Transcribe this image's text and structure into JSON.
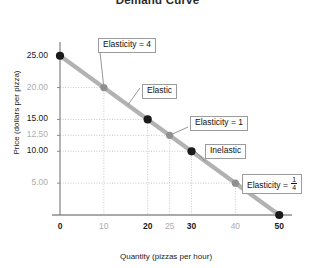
{
  "chart_data": {
    "type": "line",
    "title": "Demand Curve",
    "xlabel": "Quantity (pizzas per hour)",
    "ylabel": "Price (dollars per pizza)",
    "xlim": [
      0,
      52
    ],
    "ylim": [
      0,
      27
    ],
    "grid": "dotted-guides",
    "legend": "none",
    "series": [
      {
        "name": "Demand",
        "color": "#b2b2b2",
        "x": [
          0,
          50
        ],
        "y": [
          25.0,
          0.0
        ]
      }
    ],
    "points": [
      {
        "x": 0,
        "y": 25.0,
        "style": "black",
        "label": ""
      },
      {
        "x": 10,
        "y": 20.0,
        "style": "gray",
        "label": "Elasticity = 4"
      },
      {
        "x": 20,
        "y": 15.0,
        "style": "black",
        "label": ""
      },
      {
        "x": 25,
        "y": 12.5,
        "style": "gray",
        "label": "Elasticity = 1"
      },
      {
        "x": 30,
        "y": 10.0,
        "style": "black",
        "label": ""
      },
      {
        "x": 40,
        "y": 5.0,
        "style": "gray",
        "label": "Elasticity = 1/4"
      },
      {
        "x": 50,
        "y": 0.0,
        "style": "black",
        "label": ""
      }
    ],
    "yticks": [
      {
        "value": 25.0,
        "label": "25.00",
        "emphasis": "major"
      },
      {
        "value": 20.0,
        "label": "20.00",
        "emphasis": "minor"
      },
      {
        "value": 15.0,
        "label": "15.00",
        "emphasis": "major"
      },
      {
        "value": 12.5,
        "label": "12.50",
        "emphasis": "minor"
      },
      {
        "value": 10.0,
        "label": "10.00",
        "emphasis": "major"
      },
      {
        "value": 5.0,
        "label": "5.00",
        "emphasis": "minor"
      }
    ],
    "xticks": [
      {
        "value": 0,
        "label": "0",
        "emphasis": "major"
      },
      {
        "value": 10,
        "label": "10",
        "emphasis": "minor"
      },
      {
        "value": 20,
        "label": "20",
        "emphasis": "major"
      },
      {
        "value": 25,
        "label": "25",
        "emphasis": "minor"
      },
      {
        "value": 30,
        "label": "30",
        "emphasis": "major"
      },
      {
        "value": 40,
        "label": "40",
        "emphasis": "minor"
      },
      {
        "value": 50,
        "label": "50",
        "emphasis": "major"
      }
    ],
    "annotations": [
      {
        "id": "elasticity-4",
        "text": "Elasticity = 4",
        "target_x": 10,
        "target_y": 20.0
      },
      {
        "id": "elastic",
        "text": "Elastic",
        "target_x": 15,
        "target_y": 17.5
      },
      {
        "id": "elasticity-1",
        "text": "Elasticity = 1",
        "target_x": 25,
        "target_y": 12.5
      },
      {
        "id": "inelastic",
        "text": "Inelastic",
        "target_x": 33,
        "target_y": 8.5
      },
      {
        "id": "elasticity-qtr",
        "text": "Elasticity = ",
        "fraction": {
          "numerator": "1",
          "denominator": "4"
        },
        "target_x": 40,
        "target_y": 5.0
      }
    ],
    "colors": {
      "line": "#b2b2b2",
      "point_primary": "#1a1a1a",
      "point_secondary": "#8f8f8f",
      "axis": "#8c8c8c",
      "guide": "#c9c9c9",
      "callout_border": "#9b9b9b"
    }
  }
}
